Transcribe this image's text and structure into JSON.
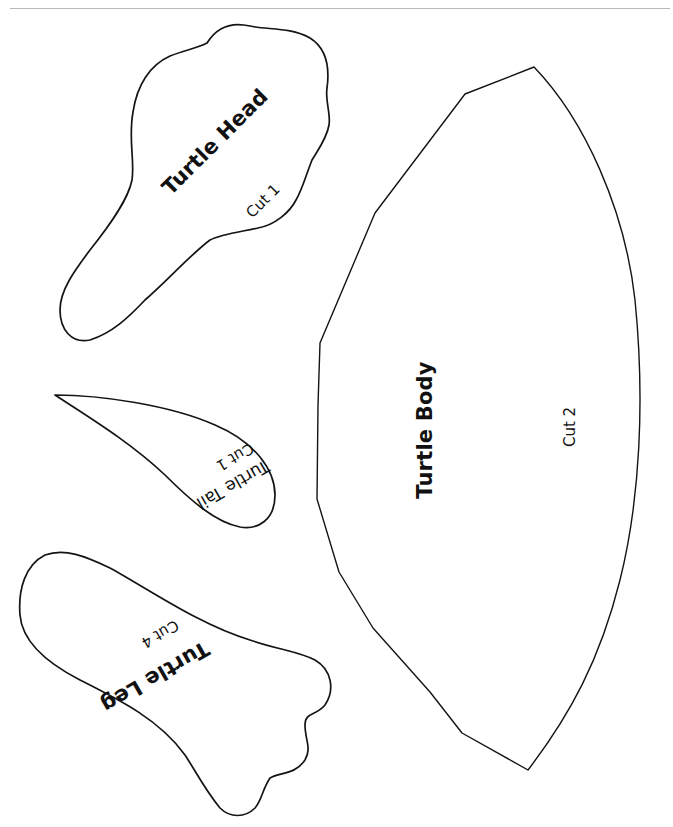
{
  "page": {
    "background": "#ffffff",
    "line_color": "#141414",
    "header_rule_color": "#b8b8b8"
  },
  "pieces": {
    "head": {
      "title": "Turtle Head",
      "cut": "Cut 1",
      "rotation_deg": -45
    },
    "tail": {
      "title": "Turtle Tail",
      "cut": "Cut 1",
      "rotation_deg": 150
    },
    "leg": {
      "title": "Turtle Leg",
      "cut": "Cut 4",
      "rotation_deg": 150
    },
    "body": {
      "title": "Turtle Body",
      "cut": "Cut 2",
      "rotation_deg": -90
    }
  }
}
